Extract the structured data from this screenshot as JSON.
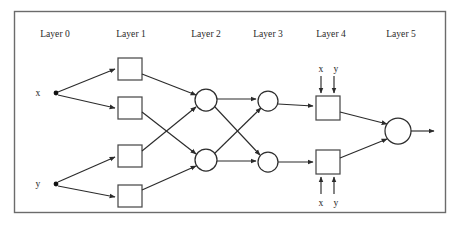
{
  "figure": {
    "kind": "neural-network-layer-diagram",
    "background_color": "#ffffff",
    "frame_color": "#6b6b6b",
    "edge_color": "#2b2b2b",
    "node_stroke_color": "#2e2e2e",
    "node_fill_color": "#ffffff"
  },
  "layer_labels": [
    {
      "id": "layer-0",
      "text": "Layer 0",
      "x": 55,
      "y": 37
    },
    {
      "id": "layer-1",
      "text": "Layer 1",
      "x": 131,
      "y": 37
    },
    {
      "id": "layer-2",
      "text": "Layer 2",
      "x": 206,
      "y": 37
    },
    {
      "id": "layer-3",
      "text": "Layer 3",
      "x": 268,
      "y": 37
    },
    {
      "id": "layer-4",
      "text": "Layer 4",
      "x": 331,
      "y": 37
    },
    {
      "id": "layer-5",
      "text": "Layer 5",
      "x": 401,
      "y": 37
    }
  ],
  "input_labels": [
    {
      "id": "input-x",
      "text": "x",
      "x": 38,
      "y": 95
    },
    {
      "id": "input-y",
      "text": "y",
      "x": 38,
      "y": 186
    }
  ],
  "side_input_labels": [
    {
      "id": "top-box-input-x",
      "text": "x",
      "x": 319,
      "y": 71
    },
    {
      "id": "top-box-input-y",
      "text": "y",
      "x": 336,
      "y": 71
    },
    {
      "id": "bottom-box-input-x",
      "text": "x",
      "x": 319,
      "y": 207
    },
    {
      "id": "bottom-box-input-y",
      "text": "y",
      "x": 336,
      "y": 207
    }
  ],
  "source_dots": [
    {
      "id": "source-dot-x",
      "cx": 56,
      "cy": 93,
      "r": 2.4
    },
    {
      "id": "source-dot-y",
      "cx": 56,
      "cy": 184,
      "r": 2.4
    }
  ],
  "layer1_boxes": [
    {
      "id": "layer1-box-1",
      "x": 118,
      "y": 58,
      "w": 24,
      "h": 22
    },
    {
      "id": "layer1-box-2",
      "x": 118,
      "y": 97,
      "w": 24,
      "h": 22
    },
    {
      "id": "layer1-box-3",
      "x": 118,
      "y": 145,
      "w": 24,
      "h": 22
    },
    {
      "id": "layer1-box-4",
      "x": 118,
      "y": 185,
      "w": 24,
      "h": 22
    }
  ],
  "layer2_circles": [
    {
      "id": "layer2-circle-1",
      "cx": 206,
      "cy": 100,
      "r": 11
    },
    {
      "id": "layer2-circle-2",
      "cx": 206,
      "cy": 160,
      "r": 11
    }
  ],
  "layer3_circles": [
    {
      "id": "layer3-circle-1",
      "cx": 268,
      "cy": 101,
      "r": 10
    },
    {
      "id": "layer3-circle-2",
      "cx": 268,
      "cy": 162,
      "r": 10
    }
  ],
  "layer4_boxes": [
    {
      "id": "layer4-box-top",
      "x": 316,
      "y": 96,
      "w": 24,
      "h": 24
    },
    {
      "id": "layer4-box-bottom",
      "x": 316,
      "y": 150,
      "w": 24,
      "h": 24
    }
  ],
  "layer5_circle": {
    "id": "layer5-output-circle",
    "cx": 398,
    "cy": 131,
    "r": 13
  },
  "output_arrow": {
    "id": "output-arrow",
    "x1": 411,
    "y1": 131,
    "x2": 436,
    "y2": 131
  }
}
